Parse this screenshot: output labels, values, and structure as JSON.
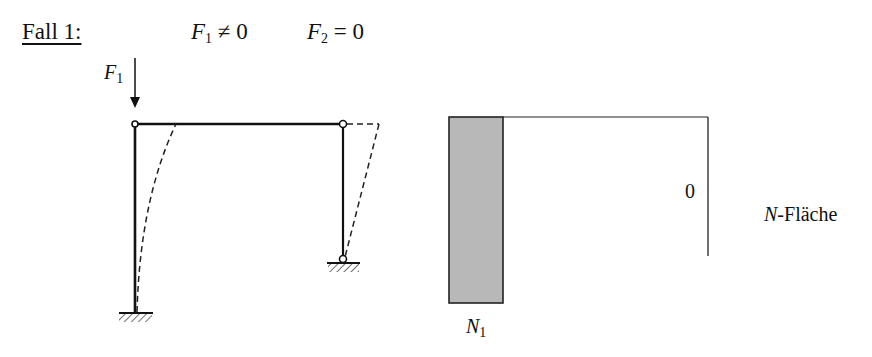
{
  "header": {
    "title": "Fall 1:",
    "condition1": {
      "symbol": "F",
      "sub": "1",
      "relation": "≠ 0"
    },
    "condition2": {
      "symbol": "F",
      "sub": "2",
      "relation": "= 0"
    }
  },
  "frame": {
    "load_label": {
      "symbol": "F",
      "sub": "1"
    },
    "load_direction": "down",
    "left_support": "fixed",
    "right_support": "pinned",
    "beam_joints": "hinged",
    "deflected_shape": "dashed"
  },
  "normal_force_diagram": {
    "label_symbol": "N",
    "label_suffix": "-Fläche",
    "left_column_value": {
      "symbol": "N",
      "sub": "1"
    },
    "right_column_value": "0",
    "fill_color": "#b8b8b8"
  }
}
